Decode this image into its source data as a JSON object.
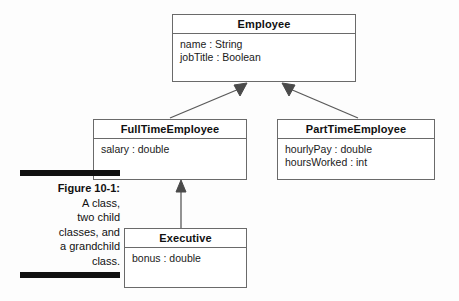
{
  "figure": {
    "caption_title": "Figure 10-1:",
    "caption_lines": [
      "A class,",
      "two child",
      "classes, and",
      "a grandchild",
      "class."
    ]
  },
  "classes": {
    "employee": {
      "name": "Employee",
      "attributes": [
        "name : String",
        "jobTitle : Boolean"
      ]
    },
    "full_time_employee": {
      "name": "FullTimeEmployee",
      "attributes": [
        "salary : double"
      ]
    },
    "part_time_employee": {
      "name": "PartTimeEmployee",
      "attributes": [
        "hourlyPay : double",
        "hoursWorked : int"
      ]
    },
    "executive": {
      "name": "Executive",
      "attributes": [
        "bonus : double"
      ]
    }
  },
  "relationships": [
    {
      "from": "FullTimeEmployee",
      "to": "Employee",
      "type": "generalization"
    },
    {
      "from": "PartTimeEmployee",
      "to": "Employee",
      "type": "generalization"
    },
    {
      "from": "Executive",
      "to": "FullTimeEmployee",
      "type": "generalization"
    }
  ],
  "colors": {
    "box_border": "#6a6a6a",
    "connector": "#5a5a5a",
    "text": "#111111",
    "caption_bar": "#111111",
    "background": "#fdfdfd"
  }
}
